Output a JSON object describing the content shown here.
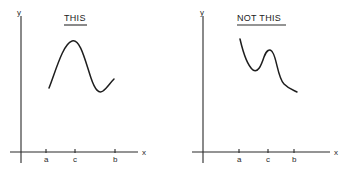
{
  "panels": [
    {
      "title": "THIS",
      "y_axis_label": "y",
      "x_axis_label": "x",
      "ticks": [
        "a",
        "c",
        "b"
      ]
    },
    {
      "title": "NOT THIS",
      "y_axis_label": "y",
      "x_axis_label": "x",
      "ticks": [
        "a",
        "c",
        "b"
      ]
    }
  ]
}
